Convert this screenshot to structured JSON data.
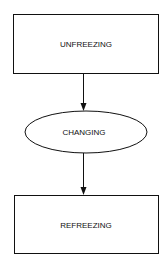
{
  "diagram": {
    "type": "flowchart",
    "nodes": [
      {
        "id": "unfreezing",
        "label": "UNFREEZING",
        "shape": "rectangle"
      },
      {
        "id": "changing",
        "label": "CHANGING",
        "shape": "ellipse"
      },
      {
        "id": "refreezing",
        "label": "REFREEZING",
        "shape": "rectangle"
      }
    ],
    "edges": [
      {
        "from": "unfreezing",
        "to": "changing"
      },
      {
        "from": "changing",
        "to": "refreezing"
      }
    ],
    "colors": {
      "stroke": "#111111",
      "background": "#ffffff"
    }
  }
}
